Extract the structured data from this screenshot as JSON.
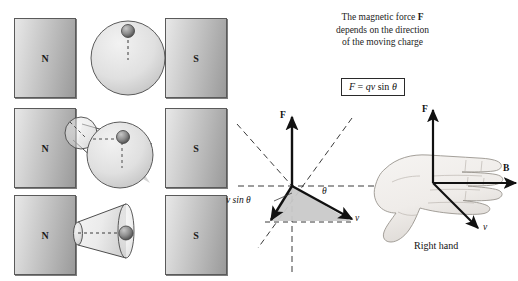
{
  "figure": {
    "background": "#ffffff",
    "magnet_gradient_light": "#e8e8e8",
    "magnet_gradient_dark": "#9a9a9a",
    "vector_fill": "#c9c9c9"
  },
  "magnets": [
    {
      "pole": "N",
      "row": 1,
      "side": "left"
    },
    {
      "pole": "S",
      "row": 1,
      "side": "right"
    },
    {
      "pole": "N",
      "row": 2,
      "side": "left"
    },
    {
      "pole": "S",
      "row": 2,
      "side": "right"
    },
    {
      "pole": "N",
      "row": 3,
      "side": "left"
    },
    {
      "pole": "S",
      "row": 3,
      "side": "right"
    }
  ],
  "caption": {
    "line1_pre": "The magnetic force ",
    "line1_symbol": "F",
    "line2": "depends on the direction",
    "line3": "of the moving charge"
  },
  "formula": {
    "lhs": "F",
    "equals": " = ",
    "rhs": "qv",
    "sin": " sin ",
    "theta": "θ"
  },
  "vector_diagram": {
    "force_label": "F",
    "velocity_label": "v",
    "component_label": "v sin θ",
    "angle_label": "θ"
  },
  "right_hand": {
    "force_label": "F",
    "field_label": "B",
    "velocity_label": "v",
    "caption": "Right hand"
  }
}
